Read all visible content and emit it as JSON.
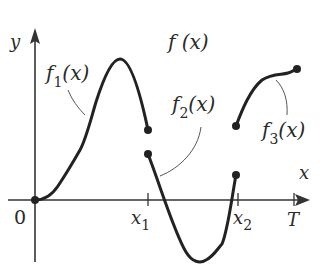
{
  "title": "f (x)",
  "axes": {
    "x_label": "x",
    "y_label": "y",
    "origin_label": "0",
    "ticks": [
      {
        "label_main": "x",
        "label_sub": "1",
        "name": "x1"
      },
      {
        "label_main": "x",
        "label_sub": "2",
        "name": "x2"
      },
      {
        "label_main": "T",
        "label_sub": "",
        "name": "T"
      }
    ]
  },
  "pieces": [
    {
      "name": "f1",
      "label_main": "f",
      "label_sub": "1",
      "label_tail": "(x)",
      "domain": "[0, x1]"
    },
    {
      "name": "f2",
      "label_main": "f",
      "label_sub": "2",
      "label_tail": "(x)",
      "domain": "[x1, x2]"
    },
    {
      "name": "f3",
      "label_main": "f",
      "label_sub": "3",
      "label_tail": "(x)",
      "domain": "[x2, T]"
    }
  ],
  "colors": {
    "ink": "#222222",
    "background": "#ffffff"
  }
}
